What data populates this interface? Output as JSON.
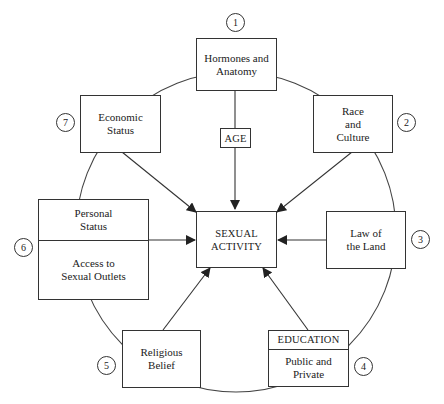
{
  "diagram": {
    "center": {
      "lines": [
        "SEXUAL",
        "ACTIVITY"
      ]
    },
    "age": {
      "label": "AGE"
    },
    "factors": [
      {
        "number": "1",
        "lines": [
          "Hormones and",
          "Anatomy"
        ]
      },
      {
        "number": "2",
        "lines": [
          "Race",
          "and",
          "Culture"
        ]
      },
      {
        "number": "3",
        "lines": [
          "Law of",
          "the Land"
        ]
      },
      {
        "number": "4",
        "header": "EDUCATION",
        "lines": [
          "Public and",
          "Private"
        ]
      },
      {
        "number": "5",
        "lines": [
          "Religious",
          "Belief"
        ]
      },
      {
        "number": "6",
        "top_lines": [
          "Personal",
          "Status"
        ],
        "bottom_lines": [
          "Access to",
          "Sexual Outlets"
        ]
      },
      {
        "number": "7",
        "lines": [
          "Economic",
          "Status"
        ]
      }
    ],
    "colors": {
      "line": "#333333",
      "background": "#ffffff"
    }
  }
}
